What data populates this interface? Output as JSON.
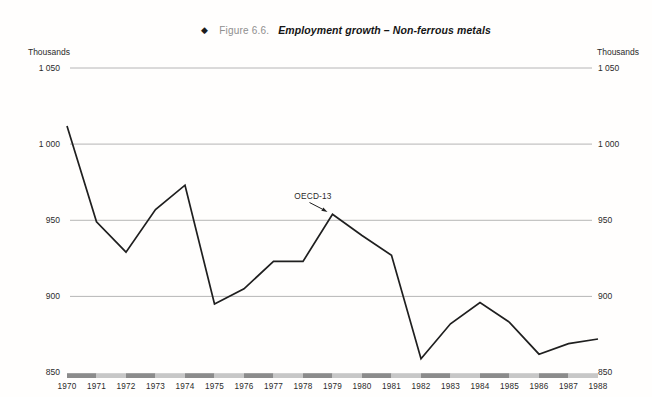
{
  "title": {
    "bullet": "◆",
    "figure_label": "Figure 6.6.",
    "title": "Employment growth – Non-ferrous metals"
  },
  "axes": {
    "unit_left": "Thousands",
    "unit_right": "Thousands"
  },
  "chart_data": {
    "type": "line",
    "title": "Employment growth – Non-ferrous metals",
    "ylabel": "Thousands",
    "x": [
      1970,
      1971,
      1972,
      1973,
      1974,
      1975,
      1976,
      1977,
      1978,
      1979,
      1980,
      1981,
      1982,
      1983,
      1984,
      1985,
      1986,
      1987,
      1988
    ],
    "series": [
      {
        "name": "OECD-13",
        "values": [
          1012,
          949,
          929,
          957,
          973,
          895,
          905,
          923,
          923,
          954,
          940,
          927,
          859,
          882,
          896,
          883,
          862,
          869,
          872
        ]
      }
    ],
    "ylim": [
      850,
      1050
    ],
    "yticks": [
      {
        "value": 850,
        "label": "850"
      },
      {
        "value": 900,
        "label": "900"
      },
      {
        "value": 950,
        "label": "950"
      },
      {
        "value": 1000,
        "label": "1 000"
      },
      {
        "value": 1050,
        "label": "1 050"
      }
    ],
    "grid": "horizontal",
    "legend": "none",
    "annotation": {
      "text": "OECD-13",
      "year": 1979,
      "value": 954
    },
    "baseline_style": "alternating-gray-bar-at-850"
  },
  "colors": {
    "line": "#1f1f1f",
    "gridline": "#a3a3a3",
    "bar_dark": "#8b8b8b",
    "bar_light": "#c7c7c7",
    "figure_label_text": "#8f8f8f",
    "text": "#2b2b2b"
  }
}
